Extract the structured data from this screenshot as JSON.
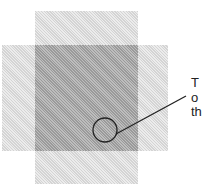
{
  "diagram": {
    "shapes": [
      {
        "name": "vertical-rectangle",
        "fill": "light hatched gray"
      },
      {
        "name": "horizontal-rectangle",
        "fill": "light hatched gray"
      },
      {
        "name": "overlap-region",
        "fill": "dark hatched gray"
      }
    ],
    "callout": {
      "target": "circle inside overlap region",
      "lines": [
        "T",
        "o",
        "th"
      ]
    },
    "colors": {
      "light": "#e2e2e2",
      "dark": "#a8a8a8",
      "stroke": "#222222"
    }
  }
}
